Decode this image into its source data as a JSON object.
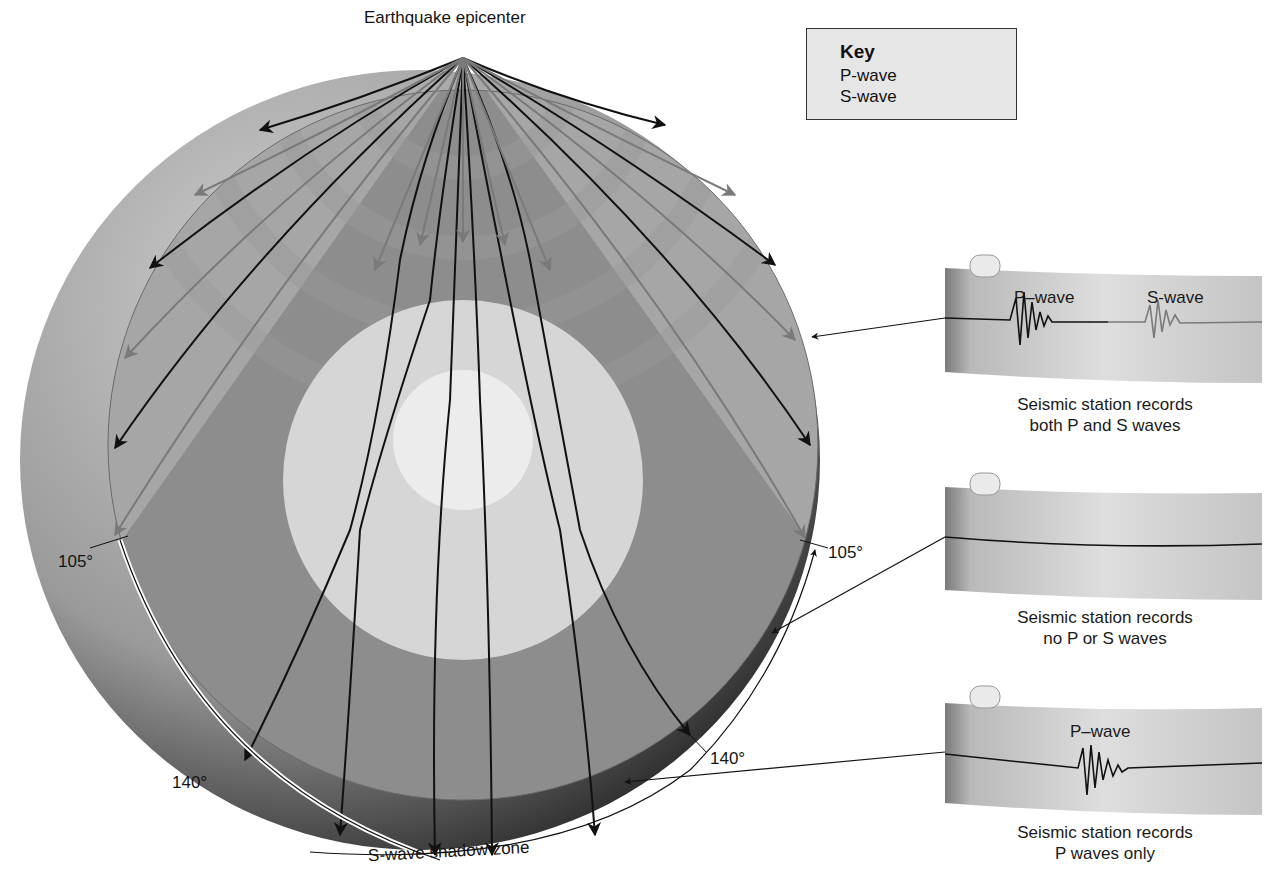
{
  "title": "Earthquake epicenter",
  "key": {
    "title": "Key",
    "items": [
      {
        "label": "P-wave",
        "color": "#111111"
      },
      {
        "label": "S-wave",
        "color": "#7a7a7a"
      }
    ]
  },
  "angles": {
    "left_105": "105°",
    "left_140": "140°",
    "right_105": "105°",
    "right_140": "140°"
  },
  "shadow_zone_label": "S-wave shadow zone",
  "stations": [
    {
      "trace_labels": [
        "P–wave",
        "S-wave"
      ],
      "caption_line1": "Seismic station records",
      "caption_line2": "both P and S waves"
    },
    {
      "trace_labels": [],
      "caption_line1": "Seismic station records",
      "caption_line2": "no P or S waves"
    },
    {
      "trace_labels": [
        "P–wave"
      ],
      "caption_line1": "Seismic station records",
      "caption_line2": "P waves only"
    }
  ],
  "colors": {
    "p_wave": "#111111",
    "s_wave": "#7a7a7a",
    "mantle_dark": "#8c8c8c",
    "mantle_light": "#a8a8a8",
    "outer_core": "#d9d9d9",
    "inner_core": "#eeeeee",
    "paper": "#c8c8c8"
  }
}
